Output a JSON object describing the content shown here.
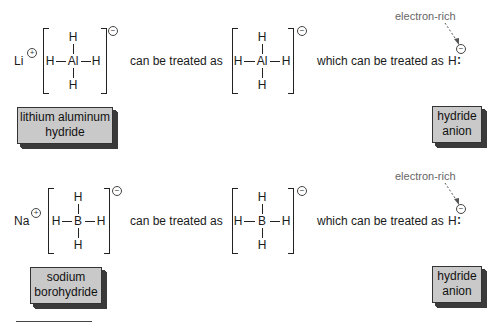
{
  "rows": [
    {
      "cation": "Li",
      "cation_charge": "+",
      "complex": {
        "center": "Al",
        "top": "H",
        "bottom": "H",
        "left": "H",
        "right": "H",
        "charge": "−"
      },
      "connector1": "can be treated as",
      "complex2": {
        "center": "Al",
        "top": "H",
        "bottom": "H",
        "left": "H",
        "right": "H",
        "charge": "−"
      },
      "connector2": "which can be treated as",
      "hydride": {
        "atom": "H",
        "lone_pair": ":",
        "charge": "−"
      },
      "annotation": "electron-rich",
      "label_left": [
        "lithium aluminum",
        "hydride"
      ],
      "label_right": [
        "hydride",
        "anion"
      ]
    },
    {
      "cation": "Na",
      "cation_charge": "+",
      "complex": {
        "center": "B",
        "top": "H",
        "bottom": "H",
        "left": "H",
        "right": "H",
        "charge": "−"
      },
      "connector1": "can be treated as",
      "complex2": {
        "center": "B",
        "top": "H",
        "bottom": "H",
        "left": "H",
        "right": "H",
        "charge": "−"
      },
      "connector2": "which can be treated as",
      "hydride": {
        "atom": "H",
        "lone_pair": ":",
        "charge": "−"
      },
      "annotation": "electron-rich",
      "label_left": [
        "sodium",
        "borohydride"
      ],
      "label_right": [
        "hydride",
        "anion"
      ]
    }
  ],
  "colors": {
    "label_fill": "#c9c9c9",
    "label_shadow": "#3a3a3a",
    "annotation_text": "#666666"
  }
}
